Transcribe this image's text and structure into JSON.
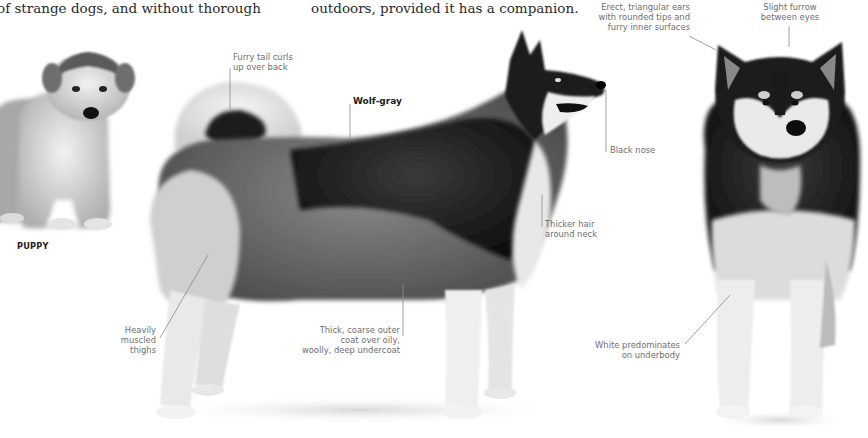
{
  "page": {
    "body_text_left": "of strange dogs, and without thorough",
    "body_text_right": "outdoors, provided it has a companion."
  },
  "figures": {
    "puppy": {
      "caption": "PUPPY"
    },
    "side_view": {
      "annotations": {
        "tail": "Furry tail curls\nup over back",
        "color": "Wolf-gray",
        "nose": "Black nose",
        "neck": "Thicker hair\naround neck",
        "thighs": "Heavily\nmuscled\nthighs",
        "coat": "Thick, coarse outer\ncoat over oily,\nwoolly, deep undercoat"
      }
    },
    "front_view": {
      "annotations": {
        "ears": "Erect, triangular ears\nwith rounded tips and\nfurry inner surfaces",
        "furrow": "Slight furrow\nbetween eyes",
        "underbody": "White predominates\non underbody"
      }
    }
  },
  "colors": {
    "text": "#2a2a2a",
    "label": "#6e6e6e",
    "leader_line": "#8a8a8a",
    "fur_dark": "#1a1a1a",
    "fur_mid": "#6a6a6a",
    "fur_light": "#e6e6e6"
  }
}
